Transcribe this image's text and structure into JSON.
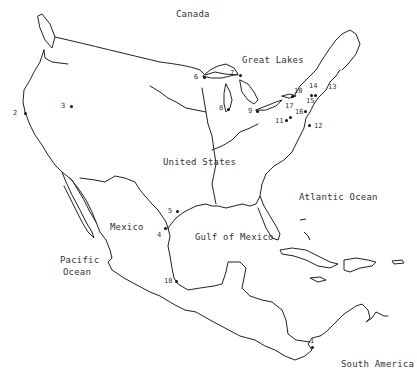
{
  "map": {
    "regions": [
      {
        "id": "canada",
        "label": "Canada",
        "x": 176,
        "y": 14
      },
      {
        "id": "great-lakes",
        "label": "Great Lakes",
        "x": 242,
        "y": 59
      },
      {
        "id": "united-states",
        "label": "United States",
        "x": 162,
        "y": 158
      },
      {
        "id": "atlantic-ocean",
        "label": "Atlantic Ocean",
        "x": 299,
        "y": 192
      },
      {
        "id": "mexico",
        "label": "Mexico",
        "x": 110,
        "y": 222
      },
      {
        "id": "gulf-of-mexico",
        "label": "Gulf of Mexico",
        "x": 194,
        "y": 232
      },
      {
        "id": "pacific-ocean-1",
        "label": "Pacific",
        "x": 60,
        "y": 255
      },
      {
        "id": "pacific-ocean-2",
        "label": "Ocean",
        "x": 63,
        "y": 268
      },
      {
        "id": "south-america",
        "label": "South America",
        "x": 340,
        "y": 359
      }
    ],
    "points": [
      {
        "id": "1",
        "label": "1",
        "lx": 310,
        "ly": 336,
        "dx": 312,
        "dy": 346
      },
      {
        "id": "2",
        "label": "2",
        "lx": 13,
        "ly": 111,
        "dx": 25,
        "dy": 113
      },
      {
        "id": "3",
        "label": "3",
        "lx": 60,
        "ly": 103,
        "dx": 71,
        "dy": 106
      },
      {
        "id": "4",
        "label": "4",
        "lx": 156,
        "ly": 232,
        "dx": 165,
        "dy": 228
      },
      {
        "id": "5",
        "label": "5",
        "lx": 168,
        "ly": 207,
        "dx": 176,
        "dy": 211
      },
      {
        "id": "6",
        "label": "6",
        "lx": 192,
        "ly": 73,
        "dx": 203,
        "dy": 76
      },
      {
        "id": "7",
        "label": "7",
        "lx": 230,
        "ly": 69,
        "dx": 239,
        "dy": 74
      },
      {
        "id": "8",
        "label": "8",
        "lx": 218,
        "ly": 104,
        "dx": 227,
        "dy": 108
      },
      {
        "id": "9",
        "label": "9",
        "lx": 248,
        "ly": 108,
        "dx": 256,
        "dy": 111
      },
      {
        "id": "10",
        "label": "10",
        "lx": 292,
        "ly": 87,
        "dx": 292,
        "dy": 96
      },
      {
        "id": "11",
        "label": "11",
        "lx": 275,
        "ly": 117,
        "dx": 285,
        "dy": 120
      },
      {
        "id": "12",
        "label": "12",
        "lx": 313,
        "ly": 123,
        "dx": 308,
        "dy": 124
      },
      {
        "id": "13",
        "label": "13",
        "lx": 327,
        "ly": 84,
        "dx": 0,
        "dy": 0
      },
      {
        "id": "14",
        "label": "14",
        "lx": 308,
        "ly": 83,
        "dx": 310,
        "dy": 95
      },
      {
        "id": "15",
        "label": "15",
        "lx": 305,
        "ly": 98,
        "dx": 314,
        "dy": 95
      },
      {
        "id": "16",
        "label": "16",
        "lx": 294,
        "ly": 109,
        "dx": 304,
        "dy": 110
      },
      {
        "id": "17",
        "label": "17",
        "lx": 285,
        "ly": 103,
        "dx": 290,
        "dy": 116
      },
      {
        "id": "18",
        "label": "18",
        "lx": 164,
        "ly": 277,
        "dx": 175,
        "dy": 281
      }
    ],
    "line_color": "#222222",
    "background": "#ffffff"
  }
}
